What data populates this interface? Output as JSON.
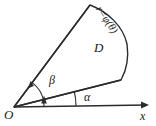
{
  "figure": {
    "kind": "polar-sector-diagram",
    "background_color": "#ffffff",
    "stroke_color": "#2b2b2b",
    "labels": {
      "origin": "O",
      "x_axis": "x",
      "region": "D",
      "angle_inner": "α",
      "angle_outer": "β",
      "curve": "r=φ(θ)"
    },
    "icons": {
      "x_axis_arrow": "arrow-right-icon",
      "angle_arc_arrow": "arc-arrow-icon"
    },
    "geometry": {
      "origin_point": [
        14,
        107
      ],
      "x_axis_end": [
        149,
        105
      ],
      "apex_point": [
        90,
        5
      ],
      "outer_bulge_point": [
        127,
        44
      ],
      "lower_right_point": [
        121,
        80
      ],
      "angle_alpha_arc_radius": 62,
      "angle_beta_arc_radius": 30
    }
  }
}
